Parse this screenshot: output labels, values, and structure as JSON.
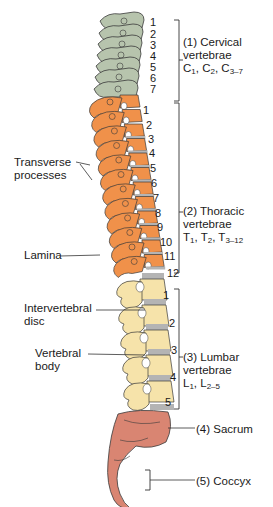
{
  "figure": {
    "colors": {
      "cervical": "#b7c4ad",
      "thoracic": "#f0914a",
      "lumbar": "#f6e3aa",
      "sacrum": "#d98572",
      "disc": "#b4b4b4",
      "outline": "#3a3a3a"
    }
  },
  "regions": [
    {
      "id": "cervical",
      "label": "(1) Cervical",
      "line2": "vertebrae",
      "notation": [
        "C",
        "1",
        ", C",
        "2",
        ", C",
        "3–7"
      ],
      "numbers": [
        "1",
        "2",
        "3",
        "4",
        "5",
        "6",
        "7"
      ]
    },
    {
      "id": "thoracic",
      "label": "(2) Thoracic",
      "line2": "vertebrae",
      "notation": [
        "T",
        "1",
        ", T",
        "2",
        ", T",
        "3–12"
      ],
      "numbers": [
        "1",
        "2",
        "3",
        "4",
        "5",
        "6",
        "7",
        "8",
        "9",
        "10",
        "11",
        "12"
      ]
    },
    {
      "id": "lumbar",
      "label": "(3) Lumbar",
      "line2": "vertebrae",
      "notation": [
        "L",
        "1",
        ", L",
        "2–5"
      ],
      "numbers": [
        "1",
        "2",
        "3",
        "4",
        "5"
      ]
    },
    {
      "id": "sacrum",
      "label": "(4) Sacrum"
    },
    {
      "id": "coccyx",
      "label": "(5) Coccyx"
    }
  ],
  "callouts": {
    "transverse": {
      "line1": "Transverse",
      "line2": "processes"
    },
    "lamina": "Lamina",
    "disc": {
      "line1": "Intervertebral",
      "line2": "disc"
    },
    "body": {
      "line1": "Vertebral",
      "line2": "body"
    }
  }
}
